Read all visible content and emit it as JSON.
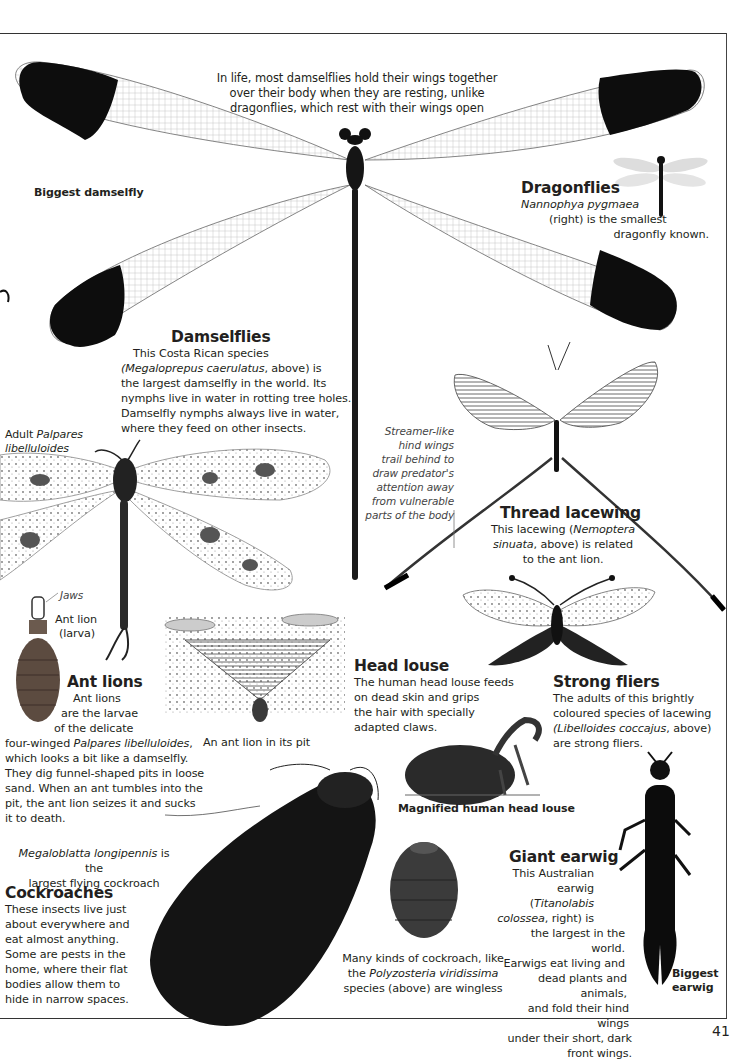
{
  "page": {
    "page_number": "41",
    "intro_note": {
      "lines": [
        "In life, most damselflies hold their wings together",
        "over their body when they are resting, unlike",
        "dragonflies, which rest with their wings open"
      ]
    },
    "biggest_damselfly_label": "Biggest damselfly",
    "dragonflies": {
      "heading": "Dragonflies",
      "species": "Nannophya pygmaea",
      "line2": "(right) is the smallest",
      "line3": "dragonfly known."
    },
    "damselflies": {
      "heading": "Damselflies",
      "line1": "This Costa Rican species",
      "species": "(Megaloprepus caerulatus",
      "line2_rest": ", above) is",
      "line3": "the largest damselfly in the world. Its",
      "line4": "nymphs live in water in rotting tree holes.",
      "line5": "Damselfly nymphs always live in water,",
      "line6": "where they feed on other insects."
    },
    "adult_palpares": {
      "prefix": "Adult ",
      "species_a": "Palpares",
      "species_b": "libelluloides"
    },
    "streamer_note": {
      "lines": [
        "Streamer-like",
        "hind wings",
        "trail behind to",
        "draw predator's",
        "attention away",
        "from vulnerable",
        "parts of the body"
      ]
    },
    "thread_lacewing": {
      "heading": "Thread lacewing",
      "line1_a": "This lacewing (",
      "species_a": "Nemoptera",
      "species_b": "sinuata",
      "line2_rest": ", above) is related",
      "line3": "to the ant lion."
    },
    "jaws_label": "Jaws",
    "ant_lion_larva_label": {
      "line1": "Ant lion",
      "line2": "(larva)"
    },
    "ant_lions": {
      "heading": "Ant lions",
      "line1": "Ant lions",
      "line2": "are the larvae",
      "line3": "of the delicate",
      "line4_a": "four-winged ",
      "species": "Palpares libelluloides",
      "line4_b": ",",
      "line5": "which looks a bit like a damselfly.",
      "line6": "They dig funnel-shaped pits in loose",
      "line7": "sand. When an ant tumbles into the",
      "line8": "pit, the ant lion seizes it and sucks",
      "line9": "it to death."
    },
    "pit_caption": "An ant lion in its pit",
    "head_louse": {
      "heading": "Head louse",
      "lines": [
        "The human head louse feeds",
        "on dead skin and grips",
        "the hair with specially",
        "adapted claws."
      ],
      "caption": "Magnified human head louse"
    },
    "strong_fliers": {
      "heading": "Strong fliers",
      "line1": "The adults of this brightly",
      "line2": "coloured species of lacewing",
      "species": "(Libelloides coccajus",
      "line3_rest": ", above)",
      "line4": "are strong fliers."
    },
    "megaloblatta": {
      "species": "Megaloblatta longipennis",
      "rest": " is the",
      "line2": "largest flying cockroach"
    },
    "cockroaches": {
      "heading": "Cockroaches",
      "lines": [
        "These insects live just",
        "about everywhere and",
        "eat almost anything.",
        "Some are pests in the",
        "home, where their flat",
        "bodies allow them to",
        "hide in narrow spaces."
      ]
    },
    "wingless_note": {
      "line1": "Many kinds of cockroach, like",
      "line2_a": "the ",
      "species": "Polyzosteria viridissima",
      "line3": "species (above) are wingless"
    },
    "giant_earwig": {
      "heading": "Giant earwig",
      "line1": "This Australian",
      "line2_a": "earwig (",
      "species_a": "Titanolabis",
      "species_b": "colossea",
      "line3_rest": ", right) is",
      "line4": "the largest in the world.",
      "line5": "Earwigs eat living and",
      "line6": "dead plants and animals,",
      "line7": "and fold their hind wings",
      "line8": "under their short, dark",
      "line9": "front wings."
    },
    "biggest_earwig_label": {
      "line1": "Biggest",
      "line2": "earwig"
    }
  }
}
